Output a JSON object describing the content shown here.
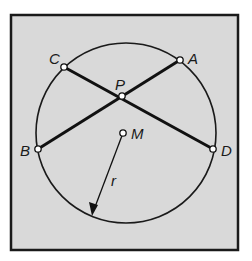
{
  "figure": {
    "frame": {
      "x": 11,
      "y": 15,
      "width": 227,
      "height": 235,
      "fill": "#d9d9d9",
      "stroke": "#1a1a1a"
    },
    "circle": {
      "cx": 126,
      "cy": 133,
      "r": 90,
      "stroke": "#1a1a1a"
    },
    "points": {
      "A": {
        "label": "A",
        "x": 180,
        "y": 60
      },
      "B": {
        "label": "B",
        "x": 38,
        "y": 149
      },
      "C": {
        "label": "C",
        "x": 64,
        "y": 67
      },
      "D": {
        "label": "D",
        "x": 213,
        "y": 149
      },
      "P": {
        "label": "P",
        "x": 122,
        "y": 96
      },
      "M": {
        "label": "M",
        "x": 123,
        "y": 133
      }
    },
    "chords": [
      {
        "name": "chord-AB",
        "from": "A",
        "to": "B"
      },
      {
        "name": "chord-CD",
        "from": "C",
        "to": "D"
      }
    ],
    "radius": {
      "label": "r",
      "from": "M",
      "to_x": 92,
      "to_y": 216
    }
  }
}
